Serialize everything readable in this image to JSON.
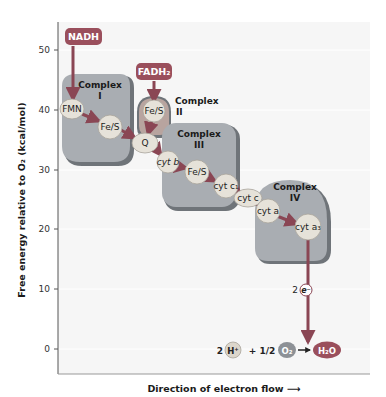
{
  "figure": {
    "y_axis": {
      "label": "Free energy relative to O₂ (kcal/mol)",
      "ticks": [
        "50",
        "40",
        "30",
        "20",
        "10",
        "0"
      ]
    },
    "x_axis": {
      "label": "Direction of electron flow ⟶"
    },
    "donors": {
      "nadh": "NADH",
      "fadh2": "FADH₂"
    },
    "complexes": [
      {
        "title": "Complex",
        "numeral": "I",
        "carriers": [
          "FMN",
          "Fe/S"
        ]
      },
      {
        "title": "Complex",
        "numeral": "II",
        "carriers": [
          "Fe/S"
        ]
      },
      {
        "title": "Complex",
        "numeral": "III",
        "carriers": [
          "cyt b",
          "Fe/S",
          "cyt c₁"
        ]
      },
      {
        "title": "Complex",
        "numeral": "IV",
        "carriers": [
          "cyt a",
          "cyt a₃"
        ]
      }
    ],
    "mobile_carriers": {
      "q": "Q",
      "cyt_c": "cyt c"
    },
    "electrons": {
      "count": "2",
      "symbol": "e⁻"
    },
    "reaction": {
      "h_coef": "2",
      "h": "H⁺",
      "plus": "+ 1/2",
      "o2": "O₂",
      "arrow": "→",
      "product": "H₂O"
    },
    "colors": {
      "donor_chip": "#9a4f5c",
      "complex_fill": "#a9adb2",
      "complex_shadow": "#6f7479",
      "carrier_fill": "#e6e2d9",
      "arrow": "#8a4654",
      "plot_bg": "#f6f6f6",
      "o2_chip": "#8d9196",
      "h2o_chip": "#9a4f5c"
    }
  }
}
